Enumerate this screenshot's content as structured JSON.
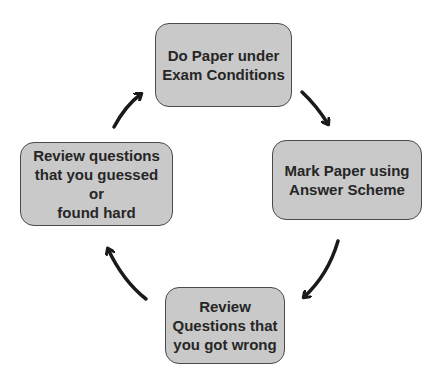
{
  "diagram": {
    "type": "cycle",
    "steps": [
      {
        "id": "do-paper",
        "label": "Do Paper under\nExam Conditions"
      },
      {
        "id": "mark-paper",
        "label": "Mark Paper using\nAnswer Scheme"
      },
      {
        "id": "review-wrong",
        "label": "Review\nQuestions that\nyou got wrong"
      },
      {
        "id": "review-guessed",
        "label": "Review questions\nthat you guessed or\nfound hard"
      }
    ],
    "arrows": [
      {
        "from": "do-paper",
        "to": "mark-paper"
      },
      {
        "from": "mark-paper",
        "to": "review-wrong"
      },
      {
        "from": "review-wrong",
        "to": "review-guessed"
      },
      {
        "from": "review-guessed",
        "to": "do-paper"
      }
    ],
    "colors": {
      "box_fill": "#c9c9c9",
      "box_border": "#4a4a4a",
      "text": "#262626",
      "arrow": "#1a1a1a",
      "background": "#ffffff"
    }
  }
}
